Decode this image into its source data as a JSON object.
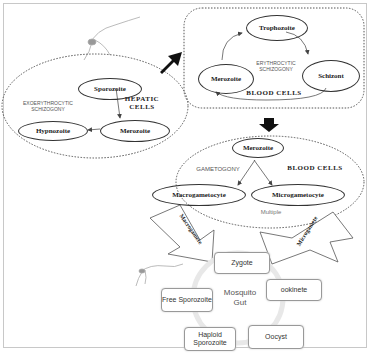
{
  "hepatic": {
    "title_line1": "HEPATIC",
    "title_line2": "CELLS",
    "stage_label_line1": "EXOERYTHROCYTIC",
    "stage_label_line2": "SCHIZOGONY",
    "nodes": [
      "Sporozoite",
      "Merozoite",
      "Hypnozoite"
    ]
  },
  "erythrocytic": {
    "title": "BLOOD CELLS",
    "stage_label_line1": "ERYTHROCYTIC",
    "stage_label_line2": "SCHIZOGONY",
    "nodes": [
      "Trophozoite",
      "Schizont",
      "Merozoite"
    ]
  },
  "gametogony": {
    "title": "BLOOD CELLS",
    "stage_label": "GAMETOGONY",
    "note": "Multiple",
    "nodes": [
      "Merozoite",
      "Macrogametocyte",
      "Microgametocyte"
    ]
  },
  "arrows": {
    "left": "Macrogamete",
    "right": "Microgamete"
  },
  "mosquito_gut": {
    "center_line1": "Mosquito",
    "center_line2": "Gut",
    "nodes": [
      "Zygote",
      "ookinete",
      "Oocyst",
      "Haploid Sporozoite",
      "Free Sporozoite"
    ]
  }
}
